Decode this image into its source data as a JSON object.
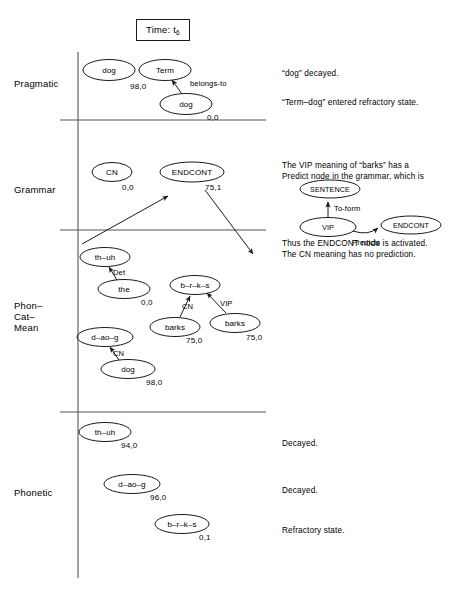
{
  "time_box": {
    "label": "Time: t",
    "subscript": "6"
  },
  "rows": [
    {
      "name": "pragmatic",
      "label": "Pragmatic"
    },
    {
      "name": "grammar",
      "label": "Grammar"
    },
    {
      "name": "phon-cat-mean",
      "label": "Phon–\nCat–\nMean"
    },
    {
      "name": "phonetic",
      "label": "Phonetic"
    }
  ],
  "notes": {
    "pragmatic_1": "“dog” decayed.",
    "pragmatic_2": "“Term–dog” entered refractory state.",
    "grammar_top": "The VIP meaning of “barks” has a\nPredict node in the grammar, which is",
    "grammar_bottom": "Thus the ENDCONT node is activated.\nThe CN meaning has no prediction.",
    "phonetic_1": "Decayed.",
    "phonetic_2": "Decayed.",
    "phonetic_3": "Refractory state."
  },
  "nodes": {
    "pragmatic": [
      {
        "name": "node-dog-pragmatic-left",
        "label": "dog",
        "activation": "98,0"
      },
      {
        "name": "node-term",
        "label": "Term",
        "activation": ""
      },
      {
        "name": "node-dog-pragmatic-right",
        "label": "dog",
        "activation": "0,0"
      }
    ],
    "grammar": [
      {
        "name": "node-cn-grammar",
        "label": "CN",
        "activation": "0,0"
      },
      {
        "name": "node-endcont-grammar",
        "label": "ENDCONT",
        "activation": "75,1"
      }
    ],
    "phon_cat_mean": [
      {
        "name": "node-th-uh-pcm",
        "label": "th–uh",
        "activation": ""
      },
      {
        "name": "node-the",
        "label": "the",
        "activation": "0,0"
      },
      {
        "name": "node-b-r-k-s-pcm",
        "label": "b–r–k–s",
        "activation": ""
      },
      {
        "name": "node-barks-cn",
        "label": "barks",
        "activation": "75,0"
      },
      {
        "name": "node-barks-vip",
        "label": "barks",
        "activation": "75,0"
      },
      {
        "name": "node-d-ao-g-pcm",
        "label": "d–ao–g",
        "activation": ""
      },
      {
        "name": "node-dog-pcm",
        "label": "dog",
        "activation": "98,0"
      }
    ],
    "phonetic": [
      {
        "name": "node-th-uh-phonetic",
        "label": "th–uh",
        "activation": "94,0"
      },
      {
        "name": "node-d-ao-g-phonetic",
        "label": "d–ao–g",
        "activation": "96,0"
      },
      {
        "name": "node-b-r-k-s-phonetic",
        "label": "b–r–k–s",
        "activation": "0,1"
      }
    ],
    "inset": [
      {
        "name": "node-sentence-inset",
        "label": "SENTENCE"
      },
      {
        "name": "node-vip-inset",
        "label": "VIP"
      },
      {
        "name": "node-endcont-inset",
        "label": "ENDCONT"
      }
    ]
  },
  "edge_labels": {
    "belongs_to": "belongs-to",
    "det": "Det",
    "cn_dog": "CN",
    "cn_barks": "CN",
    "vip_barks": "VIP",
    "to_form": "To-form",
    "predicts": "Predicts"
  },
  "colors": {
    "stroke": "#1a1a1a",
    "axis": "#55555a",
    "background": "#ffffff"
  }
}
